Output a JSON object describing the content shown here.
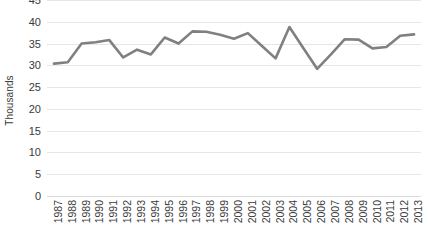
{
  "chart_data": {
    "type": "line",
    "title": "",
    "xlabel": "",
    "ylabel": "Thousands",
    "ylim": [
      0,
      45
    ],
    "yticks": [
      0,
      5,
      10,
      15,
      20,
      25,
      30,
      35,
      40,
      45
    ],
    "grid": true,
    "legend": false,
    "series_color": "#808080",
    "gridline_color": "#e6e6e6",
    "text_color": "#3b3b3b",
    "categories": [
      "1987",
      "1988",
      "1989",
      "1990",
      "1991",
      "1992",
      "1993",
      "1994",
      "1995",
      "1996",
      "1997",
      "1998",
      "1999",
      "2000",
      "2001",
      "2002",
      "2003",
      "2004",
      "2005",
      "2006",
      "2007",
      "2008",
      "2009",
      "2010",
      "2011",
      "2012",
      "2013"
    ],
    "values": [
      30.4,
      30.7,
      35.0,
      35.3,
      35.8,
      31.8,
      33.6,
      32.5,
      36.4,
      35.0,
      37.8,
      37.7,
      37.0,
      36.1,
      37.4,
      34.5,
      31.6,
      38.8,
      34.0,
      29.2,
      32.5,
      36.0,
      35.9,
      33.9,
      34.2,
      36.8,
      37.1
    ]
  }
}
